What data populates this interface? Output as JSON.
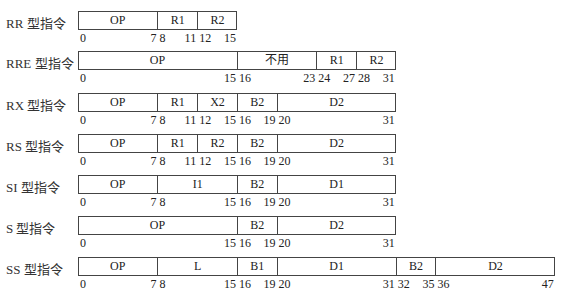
{
  "diagram": {
    "title": "",
    "rows": [
      {
        "label": "RR 型指令",
        "total_bits": 16,
        "fields": [
          {
            "name": "OP",
            "start": 0,
            "end": 7
          },
          {
            "name": "R1",
            "start": 8,
            "end": 11
          },
          {
            "name": "R2",
            "start": 12,
            "end": 15
          }
        ]
      },
      {
        "label": "RRE 型指令",
        "total_bits": 32,
        "fields": [
          {
            "name": "OP",
            "start": 0,
            "end": 15
          },
          {
            "name": "不用",
            "start": 16,
            "end": 23
          },
          {
            "name": "R1",
            "start": 24,
            "end": 27
          },
          {
            "name": "R2",
            "start": 28,
            "end": 31
          }
        ]
      },
      {
        "label": "RX 型指令",
        "total_bits": 32,
        "fields": [
          {
            "name": "OP",
            "start": 0,
            "end": 7
          },
          {
            "name": "R1",
            "start": 8,
            "end": 11
          },
          {
            "name": "X2",
            "start": 12,
            "end": 15
          },
          {
            "name": "B2",
            "start": 16,
            "end": 19
          },
          {
            "name": "D2",
            "start": 20,
            "end": 31
          }
        ]
      },
      {
        "label": "RS 型指令",
        "total_bits": 32,
        "fields": [
          {
            "name": "OP",
            "start": 0,
            "end": 7
          },
          {
            "name": "R1",
            "start": 8,
            "end": 11
          },
          {
            "name": "R2",
            "start": 12,
            "end": 15
          },
          {
            "name": "B2",
            "start": 16,
            "end": 19
          },
          {
            "name": "D2",
            "start": 20,
            "end": 31
          }
        ]
      },
      {
        "label": "SI 型指令",
        "total_bits": 32,
        "fields": [
          {
            "name": "OP",
            "start": 0,
            "end": 7
          },
          {
            "name": "I1",
            "start": 8,
            "end": 15
          },
          {
            "name": "B2",
            "start": 16,
            "end": 19
          },
          {
            "name": "D1",
            "start": 20,
            "end": 31
          }
        ]
      },
      {
        "label": "S  型指令",
        "total_bits": 32,
        "fields": [
          {
            "name": "OP",
            "start": 0,
            "end": 15
          },
          {
            "name": "B2",
            "start": 16,
            "end": 19
          },
          {
            "name": "D2",
            "start": 20,
            "end": 31
          }
        ]
      },
      {
        "label": "SS 型指令",
        "total_bits": 48,
        "fields": [
          {
            "name": "OP",
            "start": 0,
            "end": 7
          },
          {
            "name": "L",
            "start": 8,
            "end": 15
          },
          {
            "name": "B1",
            "start": 16,
            "end": 19
          },
          {
            "name": "D1",
            "start": 20,
            "end": 31
          },
          {
            "name": "B2",
            "start": 32,
            "end": 35
          },
          {
            "name": "D2",
            "start": 36,
            "end": 47
          }
        ]
      }
    ]
  }
}
